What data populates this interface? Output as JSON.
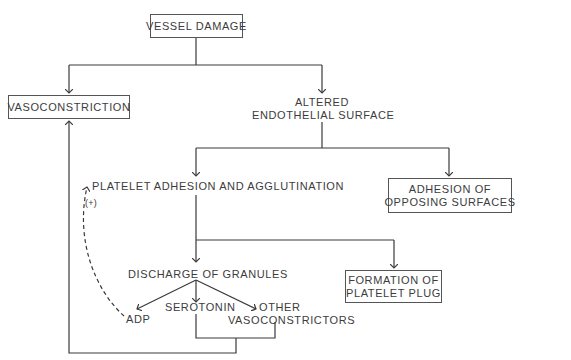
{
  "diagram": {
    "type": "flowchart",
    "colors": {
      "line": "#3a3a3a",
      "text": "#3c3c3c",
      "box_border": "#555555",
      "background": "#ffffff"
    },
    "nodes": {
      "vessel_damage": {
        "label": "VESSEL DAMAGE",
        "boxed": true
      },
      "vasoconstriction": {
        "label": "VASOCONSTRICTION",
        "boxed": true
      },
      "altered_endothelial": {
        "line1": "ALTERED",
        "line2": "ENDOTHELIAL SURFACE",
        "boxed": false
      },
      "platelet_adhesion": {
        "label": "PLATELET ADHESION AND AGGLUTINATION",
        "boxed": false
      },
      "adhesion_opposing": {
        "line1": "ADHESION OF",
        "line2": "OPPOSING SURFACES",
        "boxed": true
      },
      "discharge_granules": {
        "label": "DISCHARGE OF GRANULES",
        "boxed": false
      },
      "formation_plug": {
        "line1": "FORMATION OF",
        "line2": "PLATELET PLUG",
        "boxed": true
      },
      "adp": {
        "label": "ADP",
        "boxed": false
      },
      "serotonin": {
        "label": "SEROTONIN",
        "boxed": false
      },
      "other_vasoconstrictors": {
        "line1": "OTHER",
        "line2": "VASOCONSTRICTORS",
        "boxed": false
      }
    },
    "annotations": {
      "positive_feedback": "(+)"
    },
    "edges": [
      {
        "from": "VESSEL DAMAGE",
        "to": "VASOCONSTRICTION",
        "style": "solid"
      },
      {
        "from": "VESSEL DAMAGE",
        "to": "ALTERED ENDOTHELIAL SURFACE",
        "style": "solid"
      },
      {
        "from": "ALTERED ENDOTHELIAL SURFACE",
        "to": "PLATELET ADHESION AND AGGLUTINATION",
        "style": "solid"
      },
      {
        "from": "ALTERED ENDOTHELIAL SURFACE",
        "to": "ADHESION OF OPPOSING SURFACES",
        "style": "solid"
      },
      {
        "from": "PLATELET ADHESION AND AGGLUTINATION",
        "to": "DISCHARGE OF GRANULES",
        "style": "solid"
      },
      {
        "from": "PLATELET ADHESION AND AGGLUTINATION",
        "to": "FORMATION OF PLATELET PLUG",
        "style": "solid"
      },
      {
        "from": "DISCHARGE OF GRANULES",
        "to": "ADP",
        "style": "solid"
      },
      {
        "from": "DISCHARGE OF GRANULES",
        "to": "SEROTONIN",
        "style": "solid"
      },
      {
        "from": "DISCHARGE OF GRANULES",
        "to": "OTHER VASOCONSTRICTORS",
        "style": "solid"
      },
      {
        "from": "ADP",
        "to": "PLATELET ADHESION AND AGGLUTINATION",
        "style": "dashed",
        "label": "(+)"
      },
      {
        "from": "SEROTONIN + OTHER VASOCONSTRICTORS",
        "to": "VASOCONSTRICTION",
        "style": "solid"
      }
    ]
  }
}
